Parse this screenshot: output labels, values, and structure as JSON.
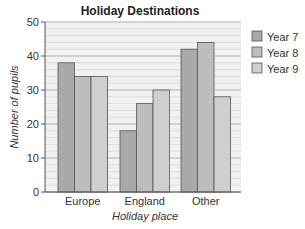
{
  "chart_data": {
    "type": "bar",
    "title": "Holiday Destinations",
    "xlabel": "Holiday place",
    "ylabel": "Number of pupils",
    "categories": [
      "Europe",
      "England",
      "Other"
    ],
    "series": [
      {
        "name": "Year 7",
        "values": [
          38,
          18,
          42
        ],
        "color": "#a9a9a9"
      },
      {
        "name": "Year 8",
        "values": [
          34,
          26,
          44
        ],
        "color": "#bdbdbd"
      },
      {
        "name": "Year 9",
        "values": [
          34,
          30,
          28
        ],
        "color": "#cfcfcf"
      }
    ],
    "ylim": [
      0,
      50
    ],
    "yticks": [
      0,
      10,
      20,
      30,
      40,
      50
    ],
    "minor_grid_step": 2,
    "grid": true,
    "legend_position": "right",
    "plot_background": "#f1f1f1",
    "grid_color": "#d8d8d8",
    "bar_edge_color": "#555555"
  }
}
